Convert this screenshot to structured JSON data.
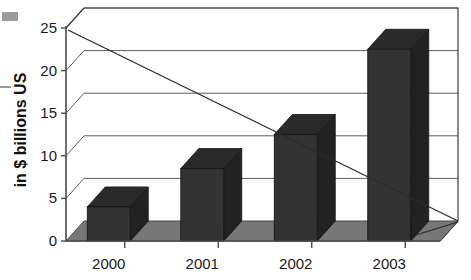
{
  "chart_data": {
    "type": "bar",
    "title": "",
    "subtitle": "",
    "xlabel": "",
    "ylabel": "in $ billions US",
    "categories": [
      "2000",
      "2001",
      "2002",
      "2003"
    ],
    "values": [
      4,
      8.5,
      12.5,
      22.5
    ],
    "series": [
      {
        "name": "in $ billions US",
        "values": [
          4,
          8.5,
          12.5,
          22.5
        ]
      }
    ],
    "ylim": [
      0,
      25
    ],
    "ytick_labels": [
      "0",
      "5",
      "10",
      "15",
      "20",
      "25"
    ],
    "ytick_values": [
      0,
      5,
      10,
      15,
      20,
      25
    ],
    "grid": true,
    "grid_axis": "y",
    "legend": false,
    "legend_position": "none",
    "style": "3d-column",
    "annotations": [
      {
        "name": "descending-trend-line",
        "type": "line",
        "from": {
          "x": "2000-axis",
          "y": 25
        },
        "to": {
          "x": "right-edge",
          "y": 0
        },
        "label": ""
      }
    ],
    "colors": {
      "bar_front": "#333333",
      "bar_top": "#2a2a2a",
      "bar_side": "#222222",
      "floor": "#777777",
      "grid": "#5d5d5d",
      "axis": "#4a4a4a",
      "text": "#1a1a1a",
      "background": "#ffffff"
    }
  },
  "axes": {
    "y_title": "in $ billions US",
    "y_ticks": [
      {
        "label": "25",
        "value": 25
      },
      {
        "label": "20",
        "value": 20
      },
      {
        "label": "15",
        "value": 15
      },
      {
        "label": "10",
        "value": 10
      },
      {
        "label": "5",
        "value": 5
      },
      {
        "label": "0",
        "value": 0
      }
    ],
    "x_ticks": [
      {
        "label": "2000"
      },
      {
        "label": "2001"
      },
      {
        "label": "2002"
      },
      {
        "label": "2003"
      }
    ]
  },
  "bars": [
    {
      "category": "2000",
      "value": 4
    },
    {
      "category": "2001",
      "value": 8.5
    },
    {
      "category": "2002",
      "value": 12.5
    },
    {
      "category": "2003",
      "value": 22.5
    }
  ]
}
